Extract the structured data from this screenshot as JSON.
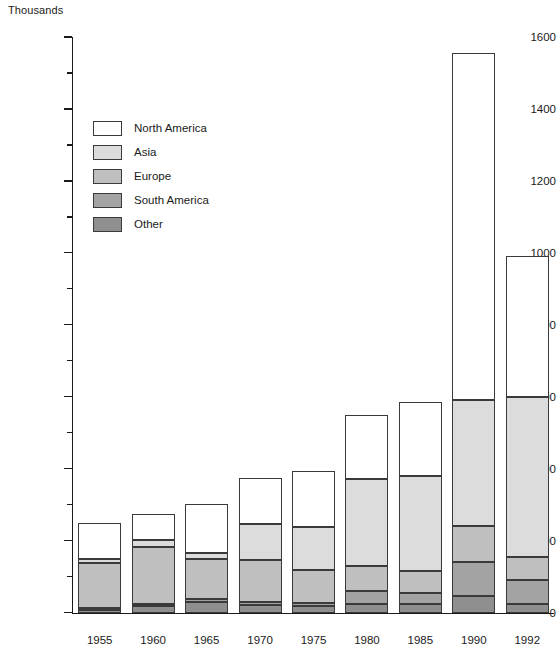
{
  "chart_data": {
    "type": "bar",
    "stacked": true,
    "title": "",
    "subtitle": "",
    "unit_label": "Thousands",
    "xlabel": "",
    "ylabel": "Thousands",
    "ylim": [
      0,
      1600
    ],
    "ytick_step": 200,
    "yminor_step": 100,
    "grid": false,
    "legend_position": "inside-upper-left",
    "categories": [
      "1955",
      "1960",
      "1965",
      "1970",
      "1975",
      "1980",
      "1985",
      "1990",
      "1992"
    ],
    "ytick_labels": [
      "0",
      "200",
      "400",
      "600",
      "800",
      "1000",
      "1200",
      "1400",
      "1600"
    ],
    "ytick_values": [
      0,
      200,
      400,
      600,
      800,
      1000,
      1200,
      1400,
      1600
    ],
    "series": [
      {
        "name": "Other",
        "color": "#8f8f8f",
        "values": [
          8,
          18,
          30,
          22,
          18,
          25,
          25,
          45,
          25
        ]
      },
      {
        "name": "South America",
        "color": "#a3a3a3",
        "values": [
          5,
          5,
          8,
          8,
          10,
          35,
          30,
          95,
          65
        ]
      },
      {
        "name": "Europe",
        "color": "#bfbfbf",
        "values": [
          125,
          158,
          112,
          115,
          90,
          70,
          60,
          100,
          65
        ]
      },
      {
        "name": "Asia",
        "color": "#dcdcdc",
        "values": [
          12,
          22,
          17,
          100,
          120,
          240,
          265,
          350,
          445
        ]
      },
      {
        "name": "North America",
        "color": "#ffffff",
        "values": [
          98,
          72,
          135,
          128,
          155,
          180,
          205,
          965,
          390
        ]
      }
    ],
    "totals": [
      248,
      275,
      302,
      373,
      393,
      550,
      585,
      1555,
      990
    ],
    "legend": [
      {
        "label": "North America",
        "color": "#ffffff"
      },
      {
        "label": "Asia",
        "color": "#dcdcdc"
      },
      {
        "label": "Europe",
        "color": "#bfbfbf"
      },
      {
        "label": "South America",
        "color": "#a3a3a3"
      },
      {
        "label": "Other",
        "color": "#8f8f8f"
      }
    ]
  }
}
